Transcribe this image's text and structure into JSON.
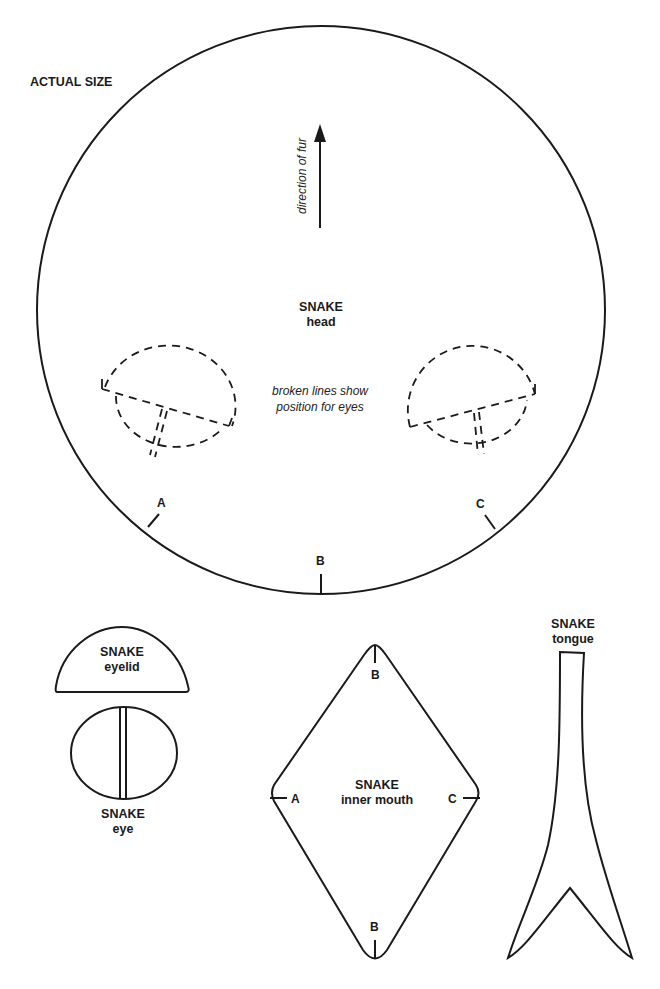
{
  "page": {
    "scale_label": "ACTUAL SIZE",
    "stroke_color": "#1a1a1a",
    "background_color": "#ffffff"
  },
  "head": {
    "title": "SNAKE",
    "subtitle": "head",
    "fur_direction_label": "direction of fur",
    "eye_note_line1": "broken lines show",
    "eye_note_line2": "position for eyes",
    "marks": {
      "a": "A",
      "b": "B",
      "c": "C"
    }
  },
  "eyelid": {
    "title": "SNAKE",
    "subtitle": "eyelid"
  },
  "eye": {
    "title": "SNAKE",
    "subtitle": "eye"
  },
  "inner_mouth": {
    "title": "SNAKE",
    "subtitle": "inner mouth",
    "marks": {
      "top": "B",
      "left": "A",
      "right": "C",
      "bottom": "B"
    }
  },
  "tongue": {
    "title": "SNAKE",
    "subtitle": "tongue"
  }
}
